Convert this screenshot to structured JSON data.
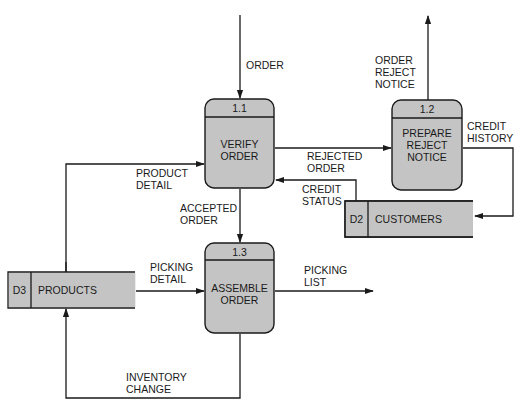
{
  "diagram": {
    "type": "data-flow-diagram",
    "colors": {
      "fill": "#c4c4c4",
      "stroke": "#1a1a1a",
      "background": "#ffffff"
    },
    "processes": [
      {
        "id": "1.1",
        "name_lines": [
          "VERIFY",
          "ORDER"
        ]
      },
      {
        "id": "1.2",
        "name_lines": [
          "PREPARE",
          "REJECT",
          "NOTICE"
        ]
      },
      {
        "id": "1.3",
        "name_lines": [
          "ASSEMBLE",
          "ORDER"
        ]
      }
    ],
    "stores": [
      {
        "id": "D2",
        "name": "CUSTOMERS"
      },
      {
        "id": "D3",
        "name": "PRODUCTS"
      }
    ],
    "flows": [
      {
        "label_lines": [
          "ORDER"
        ],
        "from": "external",
        "to": "1.1"
      },
      {
        "label_lines": [
          "ORDER",
          "REJECT",
          "NOTICE"
        ],
        "from": "1.2",
        "to": "external"
      },
      {
        "label_lines": [
          "REJECTED",
          "ORDER"
        ],
        "from": "1.1",
        "to": "1.2"
      },
      {
        "label_lines": [
          "CREDIT",
          "HISTORY"
        ],
        "from": "1.2",
        "to": "D2"
      },
      {
        "label_lines": [
          "CREDIT",
          "STATUS"
        ],
        "from": "D2",
        "to": "1.1"
      },
      {
        "label_lines": [
          "PRODUCT",
          "DETAIL"
        ],
        "from": "D3",
        "to": "1.1"
      },
      {
        "label_lines": [
          "ACCEPTED",
          "ORDER"
        ],
        "from": "1.1",
        "to": "1.3"
      },
      {
        "label_lines": [
          "PICKING",
          "DETAIL"
        ],
        "from": "D3",
        "to": "1.3"
      },
      {
        "label_lines": [
          "PICKING",
          "LIST"
        ],
        "from": "1.3",
        "to": "external"
      },
      {
        "label_lines": [
          "INVENTORY",
          "CHANGE"
        ],
        "from": "1.3",
        "to": "D3"
      }
    ]
  }
}
